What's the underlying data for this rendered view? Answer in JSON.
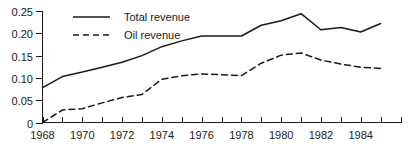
{
  "chart_data": {
    "type": "line",
    "title": "",
    "xlabel": "",
    "ylabel": "",
    "xlim": [
      1968,
      1986
    ],
    "ylim": [
      0,
      0.25
    ],
    "grid": false,
    "legend_position": "top-left",
    "x": [
      1968,
      1969,
      1970,
      1971,
      1972,
      1973,
      1974,
      1975,
      1976,
      1977,
      1978,
      1979,
      1980,
      1981,
      1982,
      1983,
      1984,
      1985
    ],
    "x_tick_labels": [
      "1968",
      "1970",
      "1972",
      "1974",
      "1976",
      "1978",
      "1980",
      "1982",
      "1984"
    ],
    "x_tick_values": [
      1968,
      1970,
      1972,
      1974,
      1976,
      1978,
      1980,
      1982,
      1984
    ],
    "y_tick_labels": [
      "0",
      "0.05",
      "0.10",
      "0.15",
      "0.20",
      "0.25"
    ],
    "y_tick_values": [
      0,
      0.05,
      0.1,
      0.15,
      0.2,
      0.25
    ],
    "series": [
      {
        "name": "Total revenue",
        "style": "solid",
        "color": "#1a1a1a",
        "values": [
          0.078,
          0.103,
          0.113,
          0.124,
          0.135,
          0.15,
          0.17,
          0.183,
          0.194,
          0.194,
          0.194,
          0.218,
          0.228,
          0.244,
          0.208,
          0.213,
          0.203,
          0.222
        ]
      },
      {
        "name": "Oil revenue",
        "style": "dashed",
        "color": "#1a1a1a",
        "values": [
          0.0,
          0.028,
          0.031,
          0.044,
          0.056,
          0.063,
          0.097,
          0.105,
          0.109,
          0.107,
          0.105,
          0.133,
          0.151,
          0.156,
          0.14,
          0.131,
          0.124,
          0.121
        ]
      }
    ]
  },
  "legend": {
    "entries": [
      {
        "label": "Total revenue"
      },
      {
        "label": "Oil revenue"
      }
    ]
  }
}
